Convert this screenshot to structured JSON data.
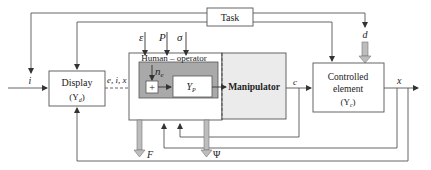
{
  "diagram": {
    "type": "block-diagram",
    "blocks": {
      "task": {
        "label": "Task"
      },
      "display": {
        "label": "Display",
        "sub": "(Y",
        "sub_index": "d",
        "sub_close": ")"
      },
      "human_operator": {
        "label": "Human – operator"
      },
      "summer": {
        "label": "+"
      },
      "yp": {
        "label": "Y",
        "sub_index": "P"
      },
      "manipulator": {
        "label": "Manipulator"
      },
      "controlled_element": {
        "line1": "Controlled",
        "line2": "element",
        "sub": "(Y",
        "sub_index": "c",
        "sub_close": ")"
      }
    },
    "signals": {
      "input_i": "i",
      "display_out": "e, i, x",
      "epsilon": "ε",
      "P": "P",
      "sigma": "σ",
      "noise": "n",
      "noise_index": "e",
      "c": "c",
      "d": "d",
      "x": "x",
      "F": "F",
      "Psi": "Ψ"
    },
    "colors": {
      "line": "#555555",
      "human_inner_fill": "#a9a9a9",
      "manipulator_fill": "#ebebeb",
      "block_border": "#555555",
      "hollow_arrow_fill": "#bdbdbd"
    }
  }
}
